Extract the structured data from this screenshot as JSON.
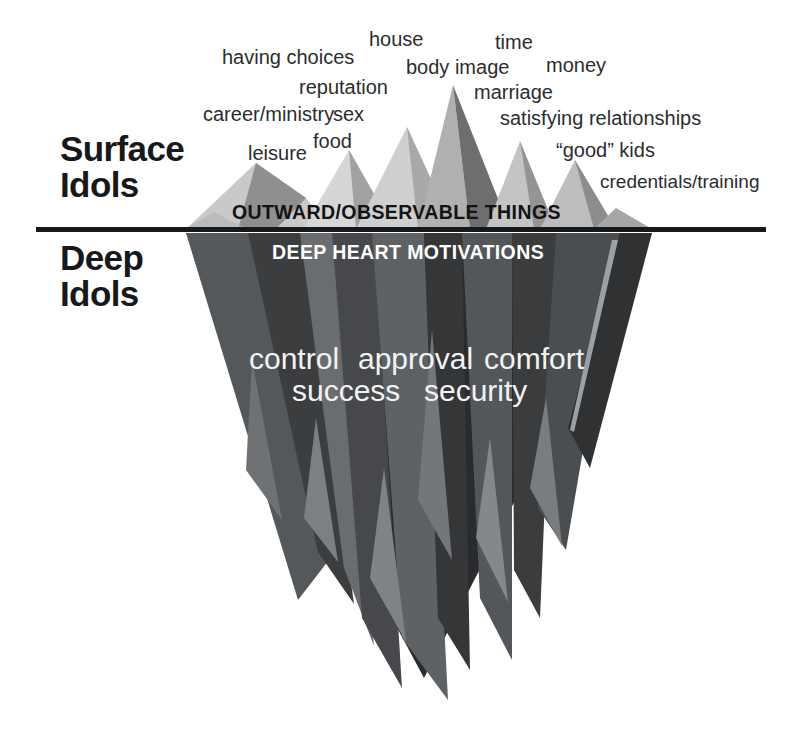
{
  "diagram": {
    "colors": {
      "background": "#ffffff",
      "waterline": "#16181a",
      "heading_text": "#16181a",
      "surface_word_text": "#2b2d2f",
      "deep_word_text": "#f2f3f4",
      "banner_above_text": "#111315",
      "banner_below_text": "#ffffff",
      "ice_lightest": "#d4d4d4",
      "ice_light": "#b8b8b8",
      "ice_mid": "#9a9a9a",
      "ice_dark": "#6d6d6d",
      "ice_darker": "#4f5052",
      "ice_deep": "#3a3b3d",
      "ice_deepest": "#232425"
    }
  },
  "sections": {
    "surface": {
      "heading": "Surface\nIdols",
      "banner": "OUTWARD/OBSERVABLE THINGS"
    },
    "deep": {
      "heading": "Deep\nIdols",
      "banner": "DEEP HEART MOTIVATIONS"
    }
  },
  "surface_idols": [
    {
      "label": "having choices",
      "x": 222,
      "y": 47,
      "size": 20
    },
    {
      "label": "house",
      "x": 369,
      "y": 29,
      "size": 20
    },
    {
      "label": "time",
      "x": 495,
      "y": 32,
      "size": 20
    },
    {
      "label": "body image",
      "x": 406,
      "y": 57,
      "size": 20
    },
    {
      "label": "money",
      "x": 546,
      "y": 55,
      "size": 20
    },
    {
      "label": "reputation",
      "x": 299,
      "y": 77,
      "size": 20
    },
    {
      "label": "marriage",
      "x": 474,
      "y": 82,
      "size": 20
    },
    {
      "label": "career/ministry",
      "x": 203,
      "y": 104,
      "size": 20
    },
    {
      "label": "sex",
      "x": 333,
      "y": 104,
      "size": 20
    },
    {
      "label": "satisfying relationships",
      "x": 500,
      "y": 108,
      "size": 20
    },
    {
      "label": "food",
      "x": 313,
      "y": 131,
      "size": 20
    },
    {
      "label": "leisure",
      "x": 248,
      "y": 143,
      "size": 20
    },
    {
      "label": "“good” kids",
      "x": 556,
      "y": 140,
      "size": 20
    },
    {
      "label": "credentials/training",
      "x": 600,
      "y": 172,
      "size": 19
    }
  ],
  "deep_idols": [
    {
      "label": "control",
      "x": 249,
      "y": 344
    },
    {
      "label": "approval",
      "x": 358,
      "y": 344
    },
    {
      "label": "comfort",
      "x": 484,
      "y": 344
    },
    {
      "label": "success",
      "x": 292,
      "y": 376
    },
    {
      "label": "security",
      "x": 424,
      "y": 376
    }
  ],
  "ice_shapes": {
    "above_water": [
      {
        "name": "left-low-ridge",
        "fill": "#c9c9c9",
        "points": "186,229 256,163 300,196 330,229"
      },
      {
        "name": "left-low-shadow",
        "fill": "#8f8f8f",
        "points": "256,163 300,196 272,229 238,229"
      },
      {
        "name": "left-mid-peak",
        "fill": "#d6d6d6",
        "points": "303,229 349,150 392,229"
      },
      {
        "name": "left-mid-shadow",
        "fill": "#a2a2a2",
        "points": "349,150 392,229 356,229"
      },
      {
        "name": "second-peak-light",
        "fill": "#cfcfcf",
        "points": "356,229 407,127 452,229"
      },
      {
        "name": "second-peak-shade",
        "fill": "#a8a8a8",
        "points": "407,127 452,229 418,229"
      },
      {
        "name": "main-peak-light",
        "fill": "#b0b0b0",
        "points": "420,229 453,85 470,229"
      },
      {
        "name": "main-peak-dark",
        "fill": "#6e6e6e",
        "points": "453,85 508,229 470,229"
      },
      {
        "name": "right-peak-light",
        "fill": "#c4c4c4",
        "points": "486,229 520,141 552,229"
      },
      {
        "name": "right-peak-shade",
        "fill": "#949494",
        "points": "520,141 556,229 534,229"
      },
      {
        "name": "far-right-peak-light",
        "fill": "#bdbdbd",
        "points": "540,229 575,160 612,229"
      },
      {
        "name": "far-right-shade",
        "fill": "#8c8c8c",
        "points": "575,160 614,229 592,229"
      },
      {
        "name": "right-foot-slab",
        "fill": "#a6a6a6",
        "points": "592,229 614,206 652,229"
      }
    ],
    "below_water": [
      {
        "name": "berg-body",
        "fill": "#2a2b2d",
        "points": "186,233 652,233 424,678"
      },
      {
        "name": "left-face-mid",
        "fill": "#55585b",
        "points": "186,233 246,233 330,560 300,600"
      },
      {
        "name": "left-spike-a",
        "fill": "#3b3d3f",
        "points": "246,233 300,233 352,606 318,556"
      },
      {
        "name": "left-spike-b",
        "fill": "#6a6d70",
        "points": "300,233 332,233 372,648 346,570"
      },
      {
        "name": "mid-left-col",
        "fill": "#46484b",
        "points": "332,233 372,233 400,690 364,620"
      },
      {
        "name": "center-col-light",
        "fill": "#5f6265",
        "points": "372,233 424,233 448,700 404,640"
      },
      {
        "name": "center-col-dark",
        "fill": "#343638",
        "points": "424,233 462,233 470,672 440,620"
      },
      {
        "name": "right-col-mid",
        "fill": "#53565a",
        "points": "462,233 512,233 512,662 482,600"
      },
      {
        "name": "right-col-dark",
        "fill": "#3a3c3e",
        "points": "512,233 556,233 540,620 516,572"
      },
      {
        "name": "right-face",
        "fill": "#4b4e51",
        "points": "556,233 620,233 566,552 540,510"
      },
      {
        "name": "far-right-sliver",
        "fill": "#2f3133",
        "points": "620,233 652,233 590,470 570,430"
      },
      {
        "name": "accent-spike-1",
        "fill": "#7d8083",
        "points": "318,420 336,560 306,520"
      },
      {
        "name": "accent-spike-2",
        "fill": "#808386",
        "points": "386,470 404,640 372,580"
      },
      {
        "name": "accent-spike-3",
        "fill": "#85888b",
        "points": "492,440 506,600 478,540"
      },
      {
        "name": "accent-spike-4",
        "fill": "#7a7d80",
        "points": "548,400 560,548 532,490"
      }
    ]
  }
}
